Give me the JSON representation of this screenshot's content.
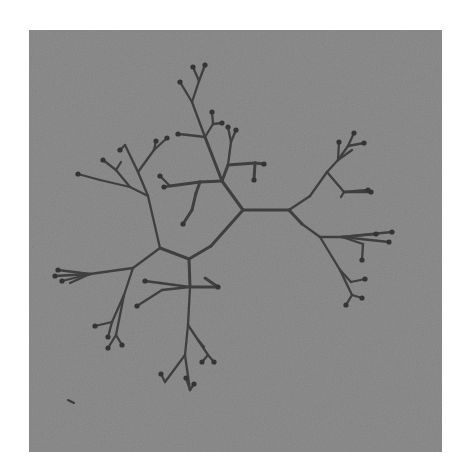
{
  "image": {
    "description": "Grayscale photograph of a branching dendritic (tree-like) network on a grainy gray square background",
    "page_background": "#ffffff",
    "panel": {
      "x": 29,
      "y": 30,
      "width": 413,
      "height": 422,
      "color": "#8e8e8e"
    },
    "stroke_color": "#3f3f3f",
    "tip_color": "#343434"
  },
  "branches": [
    [
      243,
      210,
      289,
      210
    ],
    [
      243,
      210,
      222,
      181
    ],
    [
      222,
      181,
      205,
      137
    ],
    [
      205,
      137,
      192,
      102
    ],
    [
      192,
      102,
      180,
      82
    ],
    [
      192,
      102,
      199,
      81
    ],
    [
      199,
      81,
      205,
      65
    ],
    [
      199,
      81,
      193,
      67
    ],
    [
      205,
      137,
      213,
      124
    ],
    [
      213,
      124,
      212,
      112
    ],
    [
      213,
      124,
      222,
      123
    ],
    [
      205,
      137,
      188,
      135
    ],
    [
      188,
      135,
      178,
      134
    ],
    [
      222,
      181,
      228,
      165
    ],
    [
      228,
      165,
      231,
      142
    ],
    [
      231,
      142,
      228,
      127
    ],
    [
      231,
      142,
      236,
      130
    ],
    [
      228,
      165,
      255,
      163
    ],
    [
      255,
      163,
      264,
      164
    ],
    [
      255,
      163,
      254,
      180
    ],
    [
      222,
      181,
      200,
      182
    ],
    [
      200,
      182,
      170,
      186
    ],
    [
      170,
      186,
      160,
      176
    ],
    [
      170,
      186,
      164,
      187
    ],
    [
      200,
      182,
      196,
      193
    ],
    [
      196,
      193,
      192,
      210
    ],
    [
      192,
      210,
      183,
      224
    ],
    [
      243,
      210,
      211,
      246
    ],
    [
      211,
      246,
      189,
      259
    ],
    [
      289,
      210,
      310,
      196
    ],
    [
      310,
      196,
      327,
      172
    ],
    [
      327,
      172,
      338,
      160
    ],
    [
      338,
      160,
      339,
      142
    ],
    [
      338,
      160,
      348,
      146
    ],
    [
      338,
      160,
      352,
      150
    ],
    [
      348,
      146,
      354,
      133
    ],
    [
      348,
      146,
      364,
      143
    ],
    [
      327,
      172,
      344,
      192
    ],
    [
      344,
      192,
      371,
      192
    ],
    [
      344,
      192,
      341,
      197
    ],
    [
      344,
      192,
      368,
      190
    ],
    [
      289,
      210,
      302,
      224
    ],
    [
      302,
      224,
      320,
      237
    ],
    [
      320,
      237,
      342,
      237
    ],
    [
      342,
      237,
      376,
      234
    ],
    [
      342,
      237,
      392,
      232
    ],
    [
      342,
      237,
      389,
      242
    ],
    [
      342,
      237,
      363,
      244
    ],
    [
      363,
      244,
      362,
      260
    ],
    [
      320,
      237,
      340,
      270
    ],
    [
      340,
      270,
      351,
      282
    ],
    [
      351,
      282,
      365,
      279
    ],
    [
      340,
      270,
      352,
      295
    ],
    [
      352,
      295,
      362,
      298
    ],
    [
      352,
      295,
      346,
      305
    ],
    [
      189,
      259,
      160,
      248
    ],
    [
      160,
      248,
      148,
      196
    ],
    [
      148,
      196,
      138,
      172
    ],
    [
      138,
      172,
      125,
      145
    ],
    [
      125,
      145,
      120,
      150
    ],
    [
      138,
      172,
      154,
      150
    ],
    [
      154,
      150,
      156,
      141
    ],
    [
      154,
      150,
      167,
      138
    ],
    [
      148,
      196,
      130,
      187
    ],
    [
      130,
      187,
      100,
      180
    ],
    [
      100,
      180,
      78,
      174
    ],
    [
      130,
      187,
      116,
      170
    ],
    [
      116,
      170,
      103,
      160
    ],
    [
      116,
      170,
      121,
      162
    ],
    [
      160,
      248,
      133,
      268
    ],
    [
      133,
      268,
      90,
      274
    ],
    [
      90,
      274,
      58,
      270
    ],
    [
      90,
      274,
      55,
      276
    ],
    [
      90,
      274,
      62,
      281
    ],
    [
      90,
      274,
      70,
      283
    ],
    [
      133,
      268,
      124,
      295
    ],
    [
      124,
      295,
      112,
      322
    ],
    [
      112,
      322,
      95,
      326
    ],
    [
      112,
      322,
      108,
      337
    ],
    [
      124,
      295,
      116,
      335
    ],
    [
      116,
      335,
      108,
      348
    ],
    [
      116,
      335,
      122,
      345
    ],
    [
      189,
      259,
      190,
      287
    ],
    [
      190,
      287,
      160,
      283
    ],
    [
      160,
      283,
      145,
      281
    ],
    [
      190,
      287,
      218,
      287
    ],
    [
      218,
      287,
      205,
      278
    ],
    [
      190,
      287,
      162,
      290
    ],
    [
      162,
      290,
      137,
      306
    ],
    [
      190,
      287,
      188,
      325
    ],
    [
      188,
      325,
      185,
      355
    ],
    [
      185,
      355,
      165,
      382
    ],
    [
      165,
      382,
      161,
      374
    ],
    [
      185,
      355,
      190,
      390
    ],
    [
      190,
      390,
      186,
      378
    ],
    [
      190,
      390,
      194,
      384
    ],
    [
      188,
      325,
      198,
      340
    ],
    [
      198,
      340,
      208,
      355
    ],
    [
      208,
      355,
      214,
      362
    ],
    [
      208,
      355,
      202,
      362
    ],
    [
      198,
      340,
      204,
      347
    ]
  ],
  "tips": [
    [
      180,
      82
    ],
    [
      205,
      65
    ],
    [
      193,
      67
    ],
    [
      212,
      112
    ],
    [
      222,
      123
    ],
    [
      178,
      134
    ],
    [
      228,
      127
    ],
    [
      236,
      130
    ],
    [
      264,
      164
    ],
    [
      254,
      180
    ],
    [
      160,
      176
    ],
    [
      164,
      187
    ],
    [
      183,
      224
    ],
    [
      339,
      142
    ],
    [
      354,
      133
    ],
    [
      364,
      143
    ],
    [
      371,
      192
    ],
    [
      368,
      190
    ],
    [
      376,
      234
    ],
    [
      392,
      232
    ],
    [
      389,
      242
    ],
    [
      362,
      260
    ],
    [
      365,
      279
    ],
    [
      362,
      298
    ],
    [
      346,
      305
    ],
    [
      120,
      150
    ],
    [
      156,
      141
    ],
    [
      167,
      138
    ],
    [
      78,
      174
    ],
    [
      103,
      160
    ],
    [
      58,
      270
    ],
    [
      55,
      276
    ],
    [
      62,
      281
    ],
    [
      95,
      326
    ],
    [
      108,
      337
    ],
    [
      108,
      348
    ],
    [
      122,
      345
    ],
    [
      145,
      281
    ],
    [
      218,
      287
    ],
    [
      137,
      306
    ],
    [
      161,
      374
    ],
    [
      186,
      378
    ],
    [
      194,
      384
    ],
    [
      214,
      362
    ],
    [
      202,
      362
    ]
  ],
  "specks": [
    [
      68,
      400,
      74,
      403
    ]
  ]
}
